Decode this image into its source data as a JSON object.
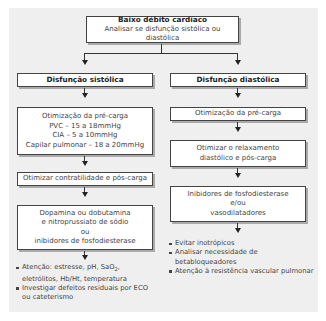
{
  "top": {
    "title": "Baixo débito cardíaco",
    "subtitle": "Analisar se disfunção sistólica ou diastólica"
  },
  "left": {
    "header": "Disfunção sistólica",
    "preload": [
      "Otimização da pré-carga",
      "PVC – 15 a 18mmHg",
      "CIA – 5 a 10mmHg",
      "Capilar pulmonar – 18 a 20mmHg"
    ],
    "contractility": "Otimizar contratilidade e pós-carga",
    "drugs": [
      "Dopamina ou dobutamina",
      "e nitroprussiato de sódio",
      "ou",
      "inibidores de fosfodiesterase"
    ],
    "notes": [
      {
        "pre": "Atenção: estresse, pH, SaO",
        "sub": "2",
        "post": ", eletrólitos, Hb/Ht, temperatura"
      },
      {
        "pre": "Investigar defeitos residuais por ECO ou cateterismo",
        "sub": "",
        "post": ""
      }
    ]
  },
  "right": {
    "header": "Disfunção diastólica",
    "preload": "Otimização da pré-carga",
    "relax": "Otimizar o relaxamento diastólico e pós-carga",
    "drugs": [
      "Inibidores de fosfodiesterase",
      "e/ou",
      "vasodilatadores"
    ],
    "notes": [
      "Evitar inotrópicos",
      "Analisar necessidade de betabloqueadores",
      "Atenção à resistência vascular pulmonar"
    ]
  },
  "colors": {
    "panel": "#efefef",
    "border": "#444444",
    "box": "#ffffff"
  }
}
